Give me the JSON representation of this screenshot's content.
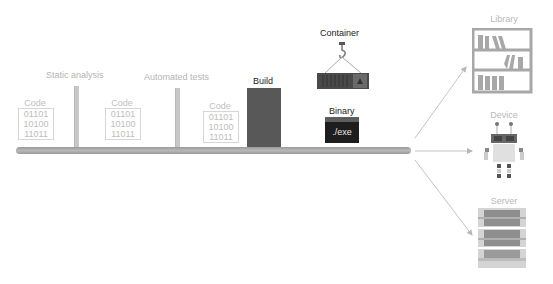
{
  "diagram": {
    "stages": [
      {
        "type": "code",
        "title": "Code",
        "lines": [
          "01101",
          "10100",
          "11011"
        ]
      },
      {
        "type": "check",
        "label": "Static analysis"
      },
      {
        "type": "code",
        "title": "Code",
        "lines": [
          "01101",
          "10100",
          "11011"
        ]
      },
      {
        "type": "check",
        "label": "Automated tests"
      },
      {
        "type": "code",
        "title": "Code",
        "lines": [
          "01101",
          "10100",
          "11011"
        ]
      },
      {
        "type": "build",
        "label": "Build"
      }
    ],
    "artifacts": {
      "container": {
        "label": "Container"
      },
      "binary": {
        "label": "Binary",
        "text": "./exe"
      }
    },
    "destinations": [
      {
        "label": "Library",
        "icon": "bookshelf-icon"
      },
      {
        "label": "Device",
        "icon": "robot-icon"
      },
      {
        "label": "Server",
        "icon": "server-rack-icon"
      }
    ],
    "colors": {
      "pipeline": "#a8a8a8",
      "build": "#585858",
      "binary": "#1d1d1d",
      "container": "#4a4a4a",
      "light_text": "#b4b4b4",
      "arrow": "#c4c4c4"
    }
  }
}
